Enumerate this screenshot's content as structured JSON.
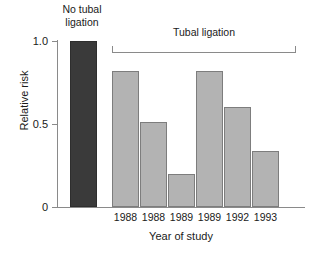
{
  "chart_data": {
    "type": "bar",
    "title": "",
    "xlabel": "Year of study",
    "ylabel": "Relative risk",
    "ylim": [
      0,
      1.0
    ],
    "yticks": [
      "0",
      "0.5",
      "1.0"
    ],
    "ytick_values": [
      0,
      0.5,
      1.0
    ],
    "grid": false,
    "legend": "none",
    "group_labels": {
      "no_tubal_ligation": "No tubal\nligation",
      "tubal_ligation": "Tubal ligation"
    },
    "categories": [
      "",
      "1988",
      "1988",
      "1989",
      "1989",
      "1992",
      "1993"
    ],
    "values": [
      1.0,
      0.82,
      0.51,
      0.2,
      0.82,
      0.6,
      0.34
    ],
    "bars": [
      {
        "label": "",
        "value": 1.0,
        "group": "No tubal ligation",
        "color": "#3a3a3a"
      },
      {
        "label": "1988",
        "value": 0.82,
        "group": "Tubal ligation",
        "color": "#b3b3b3"
      },
      {
        "label": "1988",
        "value": 0.51,
        "group": "Tubal ligation",
        "color": "#b3b3b3"
      },
      {
        "label": "1989",
        "value": 0.2,
        "group": "Tubal ligation",
        "color": "#b3b3b3"
      },
      {
        "label": "1989",
        "value": 0.82,
        "group": "Tubal ligation",
        "color": "#b3b3b3"
      },
      {
        "label": "1992",
        "value": 0.6,
        "group": "Tubal ligation",
        "color": "#b3b3b3"
      },
      {
        "label": "1993",
        "value": 0.34,
        "group": "Tubal ligation",
        "color": "#b3b3b3"
      }
    ],
    "colors": {
      "no_tubal_ligation_bar": "#3a3a3a",
      "tubal_ligation_bar": "#b3b3b3",
      "bar_outline": "#7d7d7d",
      "axis": "#8a8a8a",
      "text": "#1a1a1a",
      "background": "#ffffff"
    }
  }
}
